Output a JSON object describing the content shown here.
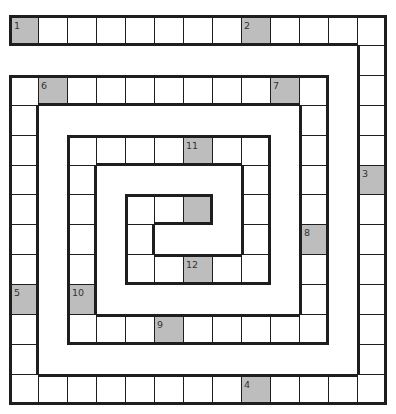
{
  "puzzle": {
    "type": "spiral-crossword-grid",
    "grid": {
      "cols": 13,
      "rows": 13,
      "origin_x": 9,
      "origin_y": 15,
      "cell_w": 29,
      "cell_h": 29.9
    },
    "colors": {
      "shaded": "#bdbdbd",
      "empty": "#ffffff",
      "border": "#1e1e1e",
      "number": "#333333"
    },
    "segments": [
      {
        "dir": "row",
        "index": 0,
        "from": 0,
        "to": 12
      },
      {
        "dir": "col",
        "index": 12,
        "from": 0,
        "to": 12
      },
      {
        "dir": "row",
        "index": 12,
        "from": 0,
        "to": 12
      },
      {
        "dir": "col",
        "index": 0,
        "from": 2,
        "to": 12
      },
      {
        "dir": "row",
        "index": 2,
        "from": 0,
        "to": 10
      },
      {
        "dir": "col",
        "index": 10,
        "from": 2,
        "to": 10
      },
      {
        "dir": "row",
        "index": 10,
        "from": 2,
        "to": 10
      },
      {
        "dir": "col",
        "index": 2,
        "from": 4,
        "to": 10
      },
      {
        "dir": "row",
        "index": 4,
        "from": 2,
        "to": 8
      },
      {
        "dir": "col",
        "index": 8,
        "from": 4,
        "to": 8
      },
      {
        "dir": "row",
        "index": 8,
        "from": 4,
        "to": 8
      },
      {
        "dir": "col",
        "index": 4,
        "from": 6,
        "to": 8
      },
      {
        "dir": "row",
        "index": 6,
        "from": 4,
        "to": 6
      }
    ],
    "shaded_cells": [
      {
        "row": 0,
        "col": 0,
        "number": "1"
      },
      {
        "row": 0,
        "col": 8,
        "number": "2"
      },
      {
        "row": 5,
        "col": 12,
        "number": "3"
      },
      {
        "row": 12,
        "col": 8,
        "number": "4"
      },
      {
        "row": 9,
        "col": 0,
        "number": "5"
      },
      {
        "row": 2,
        "col": 1,
        "number": "6"
      },
      {
        "row": 2,
        "col": 9,
        "number": "7"
      },
      {
        "row": 7,
        "col": 10,
        "number": "8"
      },
      {
        "row": 10,
        "col": 5,
        "number": "9"
      },
      {
        "row": 9,
        "col": 2,
        "number": "10"
      },
      {
        "row": 4,
        "col": 6,
        "number": "11"
      },
      {
        "row": 8,
        "col": 6,
        "number": "12"
      },
      {
        "row": 6,
        "col": 6,
        "number": ""
      }
    ]
  }
}
